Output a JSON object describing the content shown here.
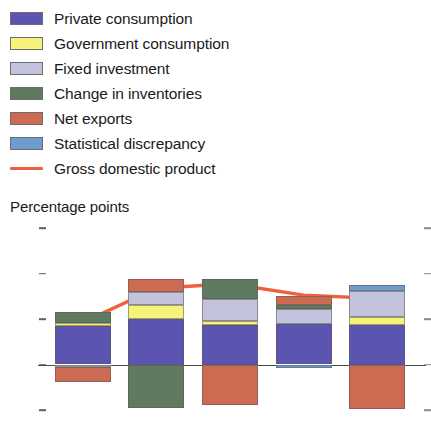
{
  "legend": {
    "items": [
      {
        "label": "Private consumption",
        "color": "#5b54b0",
        "icon": "swatch-private-consumption",
        "type": "swatch"
      },
      {
        "label": "Government consumption",
        "color": "#f7f27a",
        "icon": "swatch-government-consumption",
        "type": "swatch"
      },
      {
        "label": "Fixed investment",
        "color": "#c3c3dd",
        "icon": "swatch-fixed-investment",
        "type": "swatch"
      },
      {
        "label": "Change in inventories",
        "color": "#5f7a60",
        "icon": "swatch-change-in-inventories",
        "type": "swatch"
      },
      {
        "label": "Net exports",
        "color": "#cc6a52",
        "icon": "swatch-net-exports",
        "type": "swatch"
      },
      {
        "label": "Statistical discrepancy",
        "color": "#6f9bcd",
        "icon": "swatch-statistical-discrepancy",
        "type": "swatch"
      },
      {
        "label": "Gross domestic product",
        "color": "#f0603c",
        "icon": "line-gross-domestic-product",
        "type": "line"
      }
    ]
  },
  "axis_title": "Percentage points",
  "chart_data": {
    "type": "bar",
    "subtype": "stacked-bar-with-line",
    "title": "",
    "subtitle": "",
    "xlabel": "",
    "ylabel": "Percentage points",
    "ylim": [
      -4,
      12
    ],
    "yticks": [
      12,
      8,
      4,
      0,
      -4
    ],
    "ytick_labels": [
      "12",
      "8",
      "4",
      "0",
      "-4"
    ],
    "grid": false,
    "legend_position": "top",
    "categories": [
      "2011",
      "2012",
      "2013",
      "2014",
      "2015"
    ],
    "series": [
      {
        "name": "Private consumption",
        "color": "#5b54b0",
        "values": [
          3.4,
          4.0,
          3.5,
          3.6,
          3.5
        ]
      },
      {
        "name": "Government consumption",
        "color": "#f7f27a",
        "values": [
          0.25,
          1.2,
          0.35,
          0.0,
          0.7
        ]
      },
      {
        "name": "Fixed investment",
        "color": "#c3c3dd",
        "values": [
          -0.2,
          1.2,
          1.9,
          1.3,
          2.3
        ]
      },
      {
        "name": "Change in inventories",
        "color": "#5f7a60",
        "values": [
          1.0,
          -3.8,
          1.8,
          0.3,
          0.0
        ]
      },
      {
        "name": "Net exports",
        "color": "#cc6a52",
        "values": [
          -1.3,
          1.1,
          -3.6,
          0.8,
          -3.9
        ]
      },
      {
        "name": "Statistical discrepancy",
        "color": "#6f9bcd",
        "values": [
          0.0,
          0.0,
          0.0,
          -0.3,
          0.5
        ]
      }
    ],
    "line_series": {
      "name": "Gross domestic product",
      "color": "#f0603c",
      "values": [
        3.7,
        6.7,
        7.1,
        6.1,
        5.8
      ]
    },
    "data_labels": [
      "3.7",
      "6.7",
      "7.1",
      "6.1",
      "5.8"
    ]
  }
}
